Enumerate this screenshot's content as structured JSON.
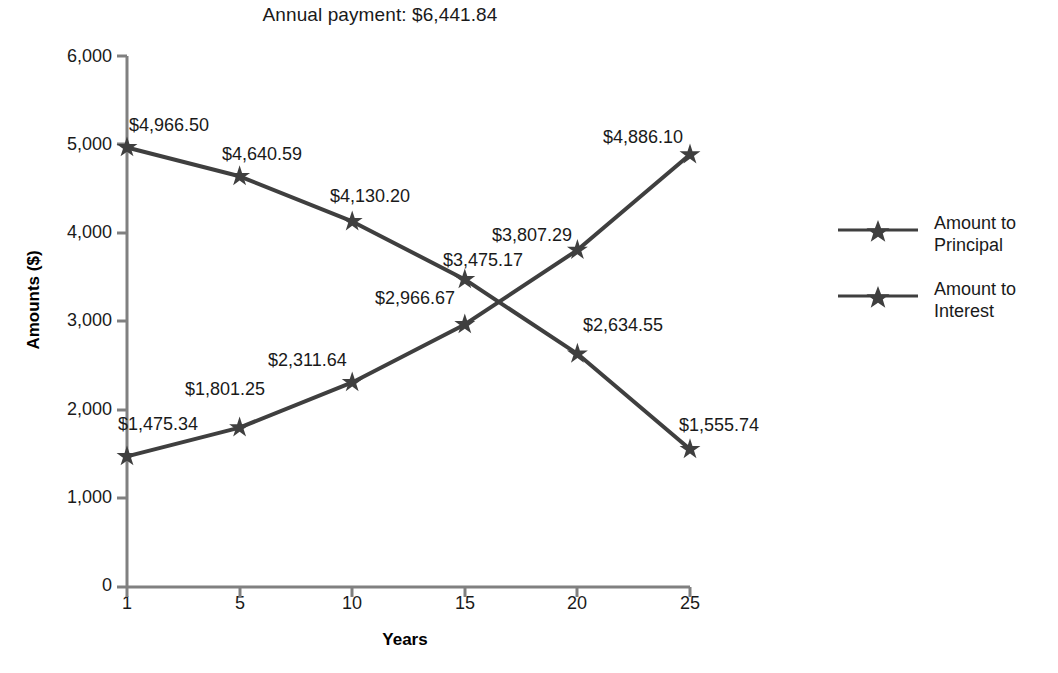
{
  "chart_data": {
    "type": "line",
    "title": "Annual payment: $6,441.84",
    "xlabel": "Years",
    "ylabel": "Amounts ($)",
    "categories": [
      "1",
      "5",
      "10",
      "15",
      "20",
      "25"
    ],
    "x": [
      1,
      5,
      10,
      15,
      20,
      25
    ],
    "ylim": [
      0,
      6000
    ],
    "yticks": [
      "0",
      "1,000",
      "2,000",
      "3,000",
      "4,000",
      "5,000",
      "6,000"
    ],
    "ytick_values": [
      0,
      1000,
      2000,
      3000,
      4000,
      5000,
      6000
    ],
    "grid": false,
    "legend_position": "right",
    "marker": "star",
    "series": [
      {
        "name": "Amount to Principal",
        "values": [
          1475.34,
          1801.25,
          2311.64,
          2966.67,
          3807.29,
          4886.1
        ],
        "labels": [
          "$1,475.34",
          "$1,801.25",
          "$2,311.64",
          "$2,966.67",
          "$3,807.29",
          "$4,886.10"
        ],
        "color": "#3f3f3f"
      },
      {
        "name": "Amount to Interest",
        "values": [
          4966.5,
          4640.59,
          4130.2,
          3475.17,
          2634.55,
          1555.74
        ],
        "labels": [
          "$4,966.50",
          "$4,640.59",
          "$4,130.20",
          "$3,475.17",
          "$2,634.55",
          "$1,555.74"
        ],
        "color": "#3f3f3f"
      }
    ],
    "axis_color": "#808080",
    "text_color": "#1a1a1a"
  },
  "legend": {
    "items": [
      {
        "label_line1": "Amount to",
        "label_line2": "Principal"
      },
      {
        "label_line1": "Amount to",
        "label_line2": "Interest"
      }
    ]
  }
}
